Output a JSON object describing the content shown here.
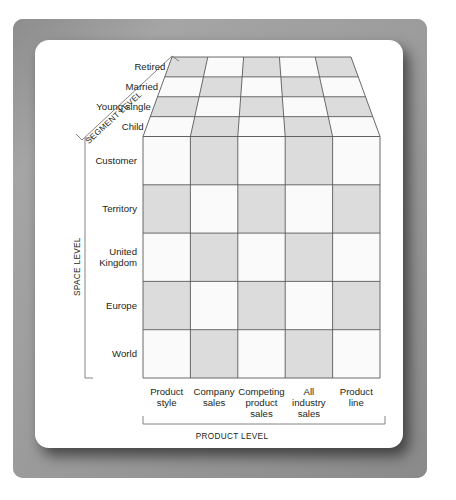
{
  "figure": {
    "kind": "three-dimensional-cube-matrix-diagram",
    "axes": {
      "segment_level": {
        "title": "SEGMENT LEVEL",
        "labels": [
          "Retired",
          "Married",
          "Young single",
          "Child"
        ]
      },
      "space_level": {
        "title": "SPACE LEVEL",
        "labels": [
          "Customer",
          "Territory",
          "United\nKingdom",
          "Europe",
          "World"
        ],
        "labels_flat": [
          "Customer",
          "Territory",
          "United Kingdom",
          "Europe",
          "World"
        ]
      },
      "product_level": {
        "title": "PRODUCT LEVEL",
        "labels": [
          "Product style",
          "Company sales",
          "Competing product sales",
          "All industry sales",
          "Product line"
        ]
      }
    },
    "space_label_lines": [
      [
        "Customer"
      ],
      [
        "Territory"
      ],
      [
        "United",
        "Kingdom"
      ],
      [
        "Europe"
      ],
      [
        "World"
      ]
    ],
    "product_label_lines": [
      [
        "Product",
        "style"
      ],
      [
        "Company",
        "sales"
      ],
      [
        "Competing",
        "product",
        "sales"
      ],
      [
        "All",
        "industry",
        "sales"
      ],
      [
        "Product",
        "line"
      ]
    ],
    "colors": {
      "frame": "#9b9b9b",
      "card": "#ffffff",
      "cell_light": "#fafafa",
      "cell_dark": "#dcdcdc",
      "grid_line": "#595959",
      "text": "#231f20",
      "bracket": "#777777"
    },
    "front_face": {
      "rows": 5,
      "cols": 5,
      "pattern": [
        [
          "light",
          "dark",
          "light",
          "dark",
          "light"
        ],
        [
          "dark",
          "light",
          "dark",
          "light",
          "dark"
        ],
        [
          "light",
          "dark",
          "light",
          "dark",
          "light"
        ],
        [
          "dark",
          "light",
          "dark",
          "light",
          "dark"
        ],
        [
          "light",
          "dark",
          "light",
          "dark",
          "light"
        ]
      ]
    },
    "top_face": {
      "rows": 4,
      "cols": 5,
      "pattern": [
        [
          "dark",
          "light",
          "dark",
          "light",
          "dark"
        ],
        [
          "light",
          "dark",
          "light",
          "dark",
          "light"
        ],
        [
          "dark",
          "light",
          "dark",
          "light",
          "dark"
        ],
        [
          "light",
          "dark",
          "light",
          "dark",
          "light"
        ]
      ]
    }
  }
}
